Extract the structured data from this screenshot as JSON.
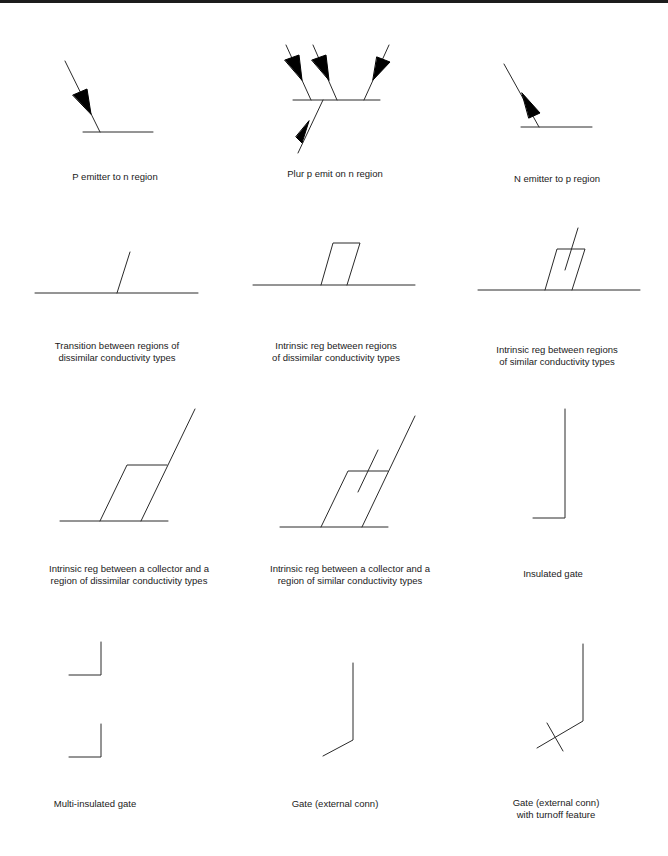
{
  "symbols": [
    {
      "id": "p-emitter",
      "label_lines": [
        "P emitter to n region"
      ],
      "caption": {
        "x": 115,
        "y": 171
      }
    },
    {
      "id": "plural-p-emitter",
      "label_lines": [
        "Plur p emit on n region"
      ],
      "caption": {
        "x": 335,
        "y": 168
      }
    },
    {
      "id": "n-emitter",
      "label_lines": [
        "N emitter to p region"
      ],
      "caption": {
        "x": 557,
        "y": 173
      }
    },
    {
      "id": "transition-dissimilar",
      "label_lines": [
        "Transition between regions of",
        "dissimilar conductivity types"
      ],
      "caption": {
        "x": 117,
        "y": 340
      }
    },
    {
      "id": "intrinsic-dissimilar",
      "label_lines": [
        "Intrinsic reg between regions",
        "of dissimilar conductivity types"
      ],
      "caption": {
        "x": 336,
        "y": 340
      }
    },
    {
      "id": "intrinsic-similar",
      "label_lines": [
        "Intrinsic reg between regions",
        "of similar conductivity types"
      ],
      "caption": {
        "x": 557,
        "y": 344
      }
    },
    {
      "id": "intrinsic-collector-dissimilar",
      "label_lines": [
        "Intrinsic reg between a collector and a",
        "region of dissimilar conductivity types"
      ],
      "caption": {
        "x": 129,
        "y": 563
      }
    },
    {
      "id": "intrinsic-collector-similar",
      "label_lines": [
        "Intrinsic reg between a collector and a",
        "region of similar conductivity types"
      ],
      "caption": {
        "x": 350,
        "y": 563
      }
    },
    {
      "id": "insulated-gate",
      "label_lines": [
        "Insulated gate"
      ],
      "caption": {
        "x": 553,
        "y": 568
      }
    },
    {
      "id": "multi-insulated-gate",
      "label_lines": [
        "Multi-insulated gate"
      ],
      "caption": {
        "x": 95,
        "y": 798
      }
    },
    {
      "id": "gate-external",
      "label_lines": [
        "Gate (external conn)"
      ],
      "caption": {
        "x": 335,
        "y": 798
      }
    },
    {
      "id": "gate-external-turnoff",
      "label_lines": [
        "Gate (external conn)",
        "with turnoff feature"
      ],
      "caption": {
        "x": 556,
        "y": 797
      }
    }
  ],
  "colors": {
    "stroke": "#2a2a2a",
    "fill": "#000000",
    "background": "#ffffff",
    "top_bar": "#1c1c1c"
  }
}
